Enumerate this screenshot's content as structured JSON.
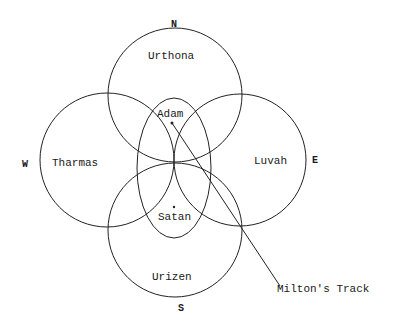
{
  "diagram": {
    "compass": {
      "north": "N",
      "south": "S",
      "east": "E",
      "west": "W"
    },
    "circles": [
      {
        "name": "Urthona",
        "position": "north"
      },
      {
        "name": "Tharmas",
        "position": "west"
      },
      {
        "name": "Luvah",
        "position": "east"
      },
      {
        "name": "Urizen",
        "position": "south"
      }
    ],
    "center_points": [
      {
        "name": "Adam"
      },
      {
        "name": "Satan"
      }
    ],
    "track_label": "Milton's Track",
    "colors": {
      "line": "#222222",
      "background": "#ffffff"
    }
  }
}
